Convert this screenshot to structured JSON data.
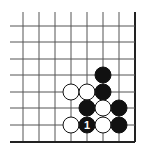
{
  "diagram": {
    "type": "go-board-fragment",
    "grid": {
      "columns_x": [
        23,
        39,
        55,
        71,
        87,
        103,
        119,
        135
      ],
      "rows_y": [
        26,
        42,
        59,
        75,
        92,
        108,
        125,
        142
      ],
      "line_start_x": 10,
      "line_start_y": 12,
      "right_edge_col": 7,
      "bottom_edge_row": 7,
      "line_color": "#555555",
      "edge_color": "#222222"
    },
    "stone_radius": 8,
    "stones": [
      {
        "color": "black",
        "col": 5,
        "row": 3,
        "label": ""
      },
      {
        "color": "white",
        "col": 3,
        "row": 4,
        "label": ""
      },
      {
        "color": "white",
        "col": 4,
        "row": 4,
        "label": ""
      },
      {
        "color": "black",
        "col": 5,
        "row": 4,
        "label": ""
      },
      {
        "color": "black",
        "col": 4,
        "row": 5,
        "label": ""
      },
      {
        "color": "white",
        "col": 5,
        "row": 5,
        "label": ""
      },
      {
        "color": "black",
        "col": 6,
        "row": 5,
        "label": ""
      },
      {
        "color": "white",
        "col": 3,
        "row": 6,
        "label": ""
      },
      {
        "color": "black",
        "col": 4,
        "row": 6,
        "label": "1"
      },
      {
        "color": "white",
        "col": 5,
        "row": 6,
        "label": ""
      },
      {
        "color": "black",
        "col": 6,
        "row": 6,
        "label": ""
      }
    ]
  }
}
